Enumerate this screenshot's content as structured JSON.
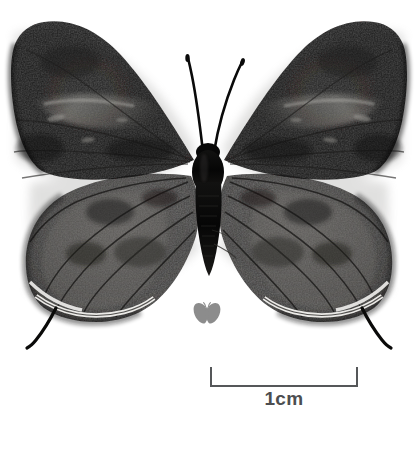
{
  "plate": {
    "title": "Butterfly specimen plate",
    "background_color": "#ffffff",
    "width": 419,
    "height": 468,
    "caption": ""
  },
  "specimen": {
    "name": "hairstreak-butterfly-specimen",
    "description": "Dorsal view of a pinned dark hairstreak butterfly specimen",
    "orientation": "dorsal",
    "colors": {
      "forewing": "#0d0d0e",
      "forewing_highlight": "#6f6e6c",
      "hindwing": "#3c3b3a",
      "hindwing_highlight": "#87857f",
      "body": "#050505",
      "antenna": "#0a0a0a",
      "fringe": "#f2f1ee",
      "shadow": "#c9c8c6"
    },
    "parts": {
      "left_forewing": "left-forewing",
      "right_forewing": "right-forewing",
      "left_hindwing": "left-hindwing",
      "right_hindwing": "right-hindwing",
      "left_antenna": "left-antenna",
      "right_antenna": "right-antenna",
      "left_tail": "left-hindwing-tail",
      "right_tail": "right-hindwing-tail",
      "thorax": "thorax",
      "abdomen": "abdomen"
    }
  },
  "logo": {
    "name": "butterfly-logo-watermark",
    "color": "#8c8c8c",
    "label": ""
  },
  "scale_bar": {
    "label": "1cm",
    "length_cm": 1,
    "color": "#555759",
    "tick_color": "#555759",
    "pixel_length": 148
  }
}
